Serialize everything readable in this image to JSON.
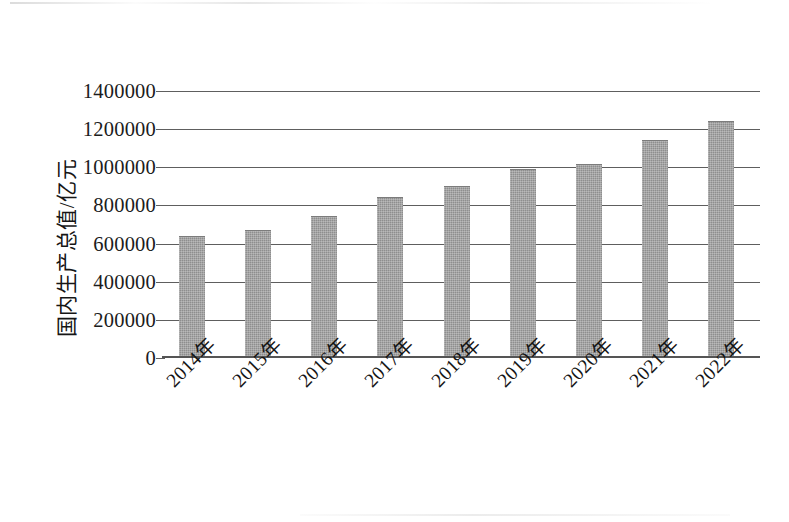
{
  "chart_data": {
    "type": "bar",
    "title": "",
    "subtitle": "",
    "xlabel": "",
    "ylabel": "国内生产总值/亿元",
    "categories": [
      "2014年",
      "2015年",
      "2016年",
      "2017年",
      "2018年",
      "2019年",
      "2020年",
      "2021年",
      "2022年"
    ],
    "values": [
      632000,
      668000,
      737000,
      837000,
      896000,
      986000,
      1013000,
      1140000,
      1237000
    ],
    "series": [
      {
        "name": "国内生产总值",
        "values": [
          632000,
          668000,
          737000,
          837000,
          896000,
          986000,
          1013000,
          1140000,
          1237000
        ]
      }
    ],
    "ylim": [
      0,
      1400000
    ],
    "ytick_values": [
      0,
      200000,
      400000,
      600000,
      800000,
      1000000,
      1200000,
      1400000
    ],
    "ytick_labels": [
      "0",
      "200000",
      "400000",
      "600000",
      "800000",
      "1000000",
      "1200000",
      "1400000"
    ],
    "grid": true,
    "grid_axis": "y",
    "legend": false,
    "legend_position": "none",
    "bar_color": "#8e8e8e",
    "axis_color": "#5e5e5e",
    "text_color": "#1a1a1a",
    "background_color": "#ffffff",
    "xtick_rotation": -45
  },
  "figure": {
    "frame_border_color": "#6f6f6f",
    "has_outer_frame": true
  }
}
